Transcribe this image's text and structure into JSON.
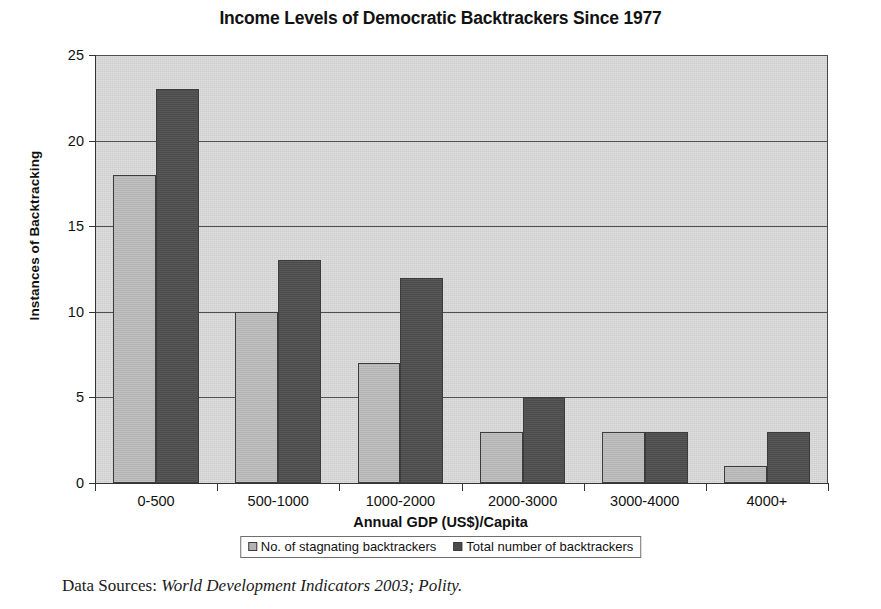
{
  "title": "Income Levels of Democratic Backtrackers Since 1977",
  "caption": {
    "lead": "Data Sources:",
    "sources": "World Development Indicators 2003; Polity."
  },
  "legend": {
    "position": "bottom",
    "entries": [
      "No. of stagnating backtrackers",
      "Total number of backtrackers"
    ]
  },
  "colors": {
    "series_0": "#b3b3b3",
    "series_1": "#4b4b4b",
    "plot_background": "#cdcdcd",
    "gridline": "#4f4f4f",
    "axis": "#333333",
    "text": "#111111"
  },
  "chart_data": {
    "type": "bar",
    "title": "Income Levels of Democratic Backtrackers Since 1977",
    "xlabel": "Annual GDP (US$)/Capita",
    "ylabel": "Instances of Backtracking",
    "categories": [
      "0-500",
      "500-1000",
      "1000-2000",
      "2000-3000",
      "3000-4000",
      "4000+"
    ],
    "series": [
      {
        "name": "No. of stagnating backtrackers",
        "color": "#b3b3b3",
        "values": [
          18,
          10,
          7,
          3,
          3,
          1
        ]
      },
      {
        "name": "Total number of backtrackers",
        "color": "#4b4b4b",
        "values": [
          23,
          13,
          12,
          5,
          3,
          3
        ]
      }
    ],
    "ylim": [
      0,
      25
    ],
    "yticks": [
      0,
      5,
      10,
      15,
      20,
      25
    ],
    "ytick_labels": [
      "0",
      "5",
      "10",
      "15",
      "20",
      "25"
    ],
    "grid": true,
    "grid_axis": "y",
    "legend_position": "bottom"
  }
}
